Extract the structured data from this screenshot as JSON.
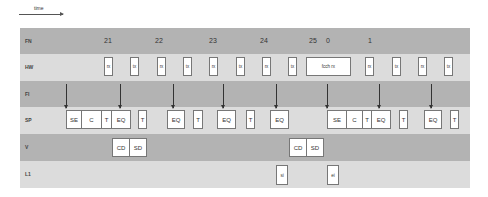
{
  "time_axis": {
    "label": "time"
  },
  "colors": {
    "dark_band": "#b3b3b3",
    "light_band": "#dcdcdc",
    "box_border": "#777777"
  },
  "rows": [
    {
      "id": "FN",
      "label": "FN"
    },
    {
      "id": "HW",
      "label": "HW"
    },
    {
      "id": "FI",
      "label": "FI"
    },
    {
      "id": "SP",
      "label": "SP"
    },
    {
      "id": "V",
      "label": "V"
    },
    {
      "id": "L1",
      "label": "L1"
    }
  ],
  "fn_numbers": [
    "21",
    "22",
    "23",
    "24",
    "25",
    "0",
    "1"
  ],
  "hw_boxes": [
    "rx",
    "tx",
    "rx",
    "tx",
    "rx",
    "tx",
    "rx",
    "tx",
    "fcch rx",
    "rx",
    "tx",
    "rx",
    "tx"
  ],
  "sp_boxes": [
    "SE",
    "C",
    "T",
    "EQ",
    "T",
    "EQ",
    "T",
    "EQ",
    "T",
    "EQ",
    "SE",
    "C",
    "T",
    "EQ",
    "T",
    "EQ",
    "T"
  ],
  "v_boxes": [
    "CD",
    "SD",
    "CD",
    "SD"
  ],
  "l1_boxes": [
    "si",
    "ei"
  ]
}
